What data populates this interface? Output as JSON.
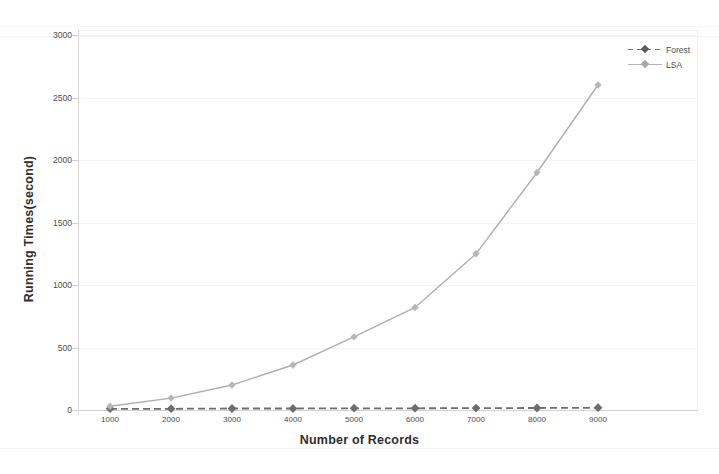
{
  "chart_data": {
    "type": "line",
    "title": "",
    "xlabel": "Number of Records",
    "ylabel": "Running Times(second)",
    "x": [
      1000,
      2000,
      3000,
      4000,
      5000,
      6000,
      7000,
      8000,
      9000
    ],
    "xticklabels": [
      "1000",
      "2000",
      "3000",
      "4000",
      "5000",
      "6000",
      "7000",
      "8000",
      "9000"
    ],
    "yticklabels": [
      "0",
      "500",
      "1000",
      "1500",
      "2000",
      "2500",
      "3000"
    ],
    "yticks": [
      0,
      500,
      1000,
      1500,
      2000,
      2500,
      3000
    ],
    "xlim": [
      1000,
      9000
    ],
    "ylim": [
      0,
      3000
    ],
    "grid": true,
    "legend_position": "top-right",
    "series": [
      {
        "name": "Forest",
        "values": [
          10,
          10,
          12,
          12,
          14,
          14,
          15,
          16,
          18
        ],
        "color": "#6e6e6e",
        "style": "dashed",
        "marker": "diamond"
      },
      {
        "name": "LSA",
        "values": [
          30,
          95,
          200,
          360,
          585,
          820,
          1250,
          1900,
          2600
        ],
        "color": "#aeaeae",
        "style": "solid",
        "marker": "diamond"
      }
    ]
  },
  "legend": {
    "entries": [
      {
        "label": "Forest"
      },
      {
        "label": "LSA"
      }
    ]
  },
  "axes": {
    "x_title": "Number of Records",
    "y_title": "Running Times(second)"
  },
  "colors": {
    "forest": "#6e6e6e",
    "lsa": "#aeaeae",
    "text": "#3f3f3f",
    "grid": "#f3f3f3",
    "background": "#ffffff"
  }
}
